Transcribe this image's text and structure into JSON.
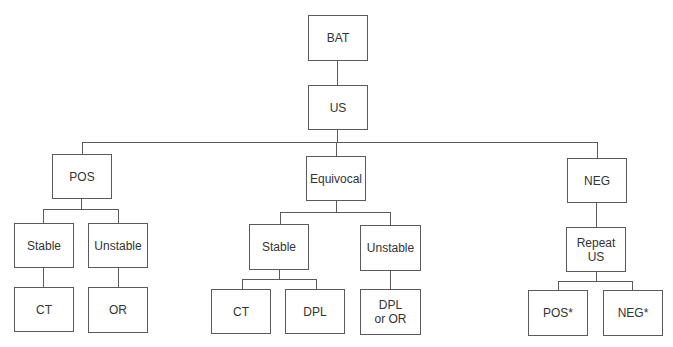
{
  "diagram": {
    "type": "decision-tree",
    "line_color": "#5a5a5a",
    "nodes": {
      "bat": "BAT",
      "us": "US",
      "pos": "POS",
      "equivocal": "Equivocal",
      "neg": "NEG",
      "pos_stable": "Stable",
      "pos_unstable": "Unstable",
      "pos_stable_ct": "CT",
      "pos_unstable_or": "OR",
      "eq_stable": "Stable",
      "eq_unstable": "Unstable",
      "eq_stable_ct": "CT",
      "eq_stable_dpl": "DPL",
      "eq_unstable_dpl_or": "DPL\nor OR",
      "repeat_us": "Repeat US",
      "repeat_pos": "POS*",
      "repeat_neg": "NEG*"
    },
    "edges": [
      [
        "BAT",
        "US"
      ],
      [
        "US",
        "POS"
      ],
      [
        "US",
        "Equivocal"
      ],
      [
        "US",
        "NEG"
      ],
      [
        "POS",
        "Stable"
      ],
      [
        "POS",
        "Unstable"
      ],
      [
        "Stable",
        "CT"
      ],
      [
        "Unstable",
        "OR"
      ],
      [
        "Equivocal",
        "Stable"
      ],
      [
        "Equivocal",
        "Unstable"
      ],
      [
        "Stable",
        "CT"
      ],
      [
        "Stable",
        "DPL"
      ],
      [
        "Unstable",
        "DPL or OR"
      ],
      [
        "NEG",
        "Repeat US"
      ],
      [
        "Repeat US",
        "POS*"
      ],
      [
        "Repeat US",
        "NEG*"
      ]
    ]
  }
}
